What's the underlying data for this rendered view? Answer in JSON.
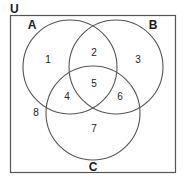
{
  "diagram": {
    "type": "venn",
    "universe_label": "U",
    "sets": [
      {
        "name": "A",
        "label": "A",
        "cx": 70,
        "cy": 67,
        "r": 47,
        "label_x": 32,
        "label_y": 29
      },
      {
        "name": "B",
        "label": "B",
        "cx": 116,
        "cy": 67,
        "r": 47,
        "label_x": 153,
        "label_y": 29
      },
      {
        "name": "C",
        "label": "C",
        "cx": 93,
        "cy": 113,
        "r": 47,
        "label_x": 93,
        "label_y": 171
      }
    ],
    "regions": [
      {
        "label": "1",
        "x": 48,
        "y": 63
      },
      {
        "label": "2",
        "x": 94,
        "y": 56
      },
      {
        "label": "3",
        "x": 138,
        "y": 63
      },
      {
        "label": "4",
        "x": 67,
        "y": 100
      },
      {
        "label": "5",
        "x": 94,
        "y": 87
      },
      {
        "label": "6",
        "x": 120,
        "y": 100
      },
      {
        "label": "7",
        "x": 94,
        "y": 132
      },
      {
        "label": "8",
        "x": 36,
        "y": 116
      }
    ],
    "colors": {
      "stroke": "#555555",
      "frame": "#555555",
      "text": "#1a1a1a"
    }
  }
}
